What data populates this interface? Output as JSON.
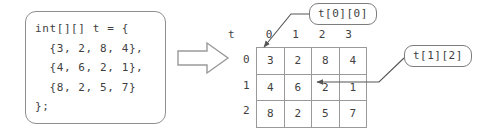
{
  "diagram": {
    "code_block": {
      "language": "java",
      "text": "int[][] t = {\n  {3, 2, 8, 4},\n  {4, 6, 2, 1},\n  {8, 2, 5, 7}\n};"
    },
    "arrow": {
      "icon": "block-arrow-right-icon",
      "direction": "right"
    },
    "table": {
      "corner_label": "t",
      "column_headers": [
        "0",
        "1",
        "2",
        "3"
      ],
      "row_headers": [
        "0",
        "1",
        "2"
      ],
      "rows": [
        [
          "3",
          "2",
          "8",
          "4"
        ],
        [
          "4",
          "6",
          "2",
          "1"
        ],
        [
          "8",
          "2",
          "5",
          "7"
        ]
      ]
    },
    "callouts": [
      {
        "label": "t[0][0]",
        "points_to_row": 0,
        "points_to_col": 0,
        "value": "3"
      },
      {
        "label": "t[1][2]",
        "points_to_row": 1,
        "points_to_col": 2,
        "value": "2"
      }
    ],
    "colors": {
      "background": "#ffffff",
      "stroke": "#8f8f8f",
      "grid_stroke": "#9a9a9a",
      "text": "#3f3f3f"
    }
  }
}
